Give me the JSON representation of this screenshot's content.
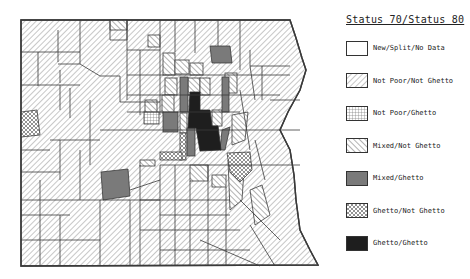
{
  "legend": {
    "title": "Status 70/Status 80",
    "items": [
      {
        "label": "New/Split/No Data",
        "pattern": "blank"
      },
      {
        "label": "Not Poor/Not Ghetto",
        "pattern": "hatch-back"
      },
      {
        "label": "Not Poor/Ghetto",
        "pattern": "grid"
      },
      {
        "label": "Mixed/Not Ghetto",
        "pattern": "hatch-forward"
      },
      {
        "label": "Mixed/Ghetto",
        "pattern": "gray-solid"
      },
      {
        "label": "Ghetto/Not Ghetto",
        "pattern": "crosshatch-dots"
      },
      {
        "label": "Ghetto/Ghetto",
        "pattern": "black-solid"
      }
    ]
  },
  "colors": {
    "outline": "#3a3a3a",
    "hatch": "#8a8a8a",
    "mixed_ghetto": "#7a7a7a",
    "ghetto_ghetto": "#1e1e1e"
  }
}
